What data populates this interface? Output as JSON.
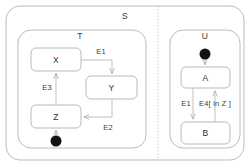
{
  "diagram": {
    "type": "uml-statechart",
    "title_visible": false,
    "colors": {
      "stroke": "#b5b5b5",
      "stroke_dark": "#9a9a9a",
      "text": "#3a3a3a",
      "fill": "#ffffff",
      "initial_fill": "#111111",
      "divider": "#c9c9c9"
    },
    "outer_state": {
      "name": "S",
      "label_x": 125,
      "label_y": 16
    },
    "divider": {
      "name": "orthogonal-region-divider",
      "style": "dashed",
      "x": 158,
      "y1": 6,
      "y2": 160
    },
    "regions": [
      {
        "name": "T",
        "label_x": 80,
        "label_y": 36,
        "box": {
          "x": 18,
          "y": 30,
          "w": 128,
          "h": 118
        }
      },
      {
        "name": "U",
        "label_x": 205,
        "label_y": 36,
        "box": {
          "x": 170,
          "y": 30,
          "w": 70,
          "h": 118
        }
      }
    ],
    "states": [
      {
        "id": "X",
        "label": "X",
        "x": 31,
        "y": 48,
        "w": 50,
        "h": 23
      },
      {
        "id": "Y",
        "label": "Y",
        "x": 86,
        "y": 76,
        "w": 51,
        "h": 23
      },
      {
        "id": "Z",
        "label": "Z",
        "x": 31,
        "y": 105,
        "w": 50,
        "h": 23
      },
      {
        "id": "A",
        "label": "A",
        "x": 181,
        "y": 67,
        "w": 49,
        "h": 21
      },
      {
        "id": "B",
        "label": "B",
        "x": 181,
        "y": 122,
        "w": 49,
        "h": 22
      }
    ],
    "initial_states": [
      {
        "id": "init-T",
        "cx": 56,
        "cy": 141,
        "r": 5.5,
        "target": "Z"
      },
      {
        "id": "init-U",
        "cx": 205,
        "cy": 54,
        "r": 5.5,
        "target": "A"
      }
    ],
    "transitions": [
      {
        "id": "t-x-y",
        "label": "E1",
        "from": "X",
        "to": "Y",
        "label_x": 101,
        "label_y": 52
      },
      {
        "id": "t-y-z",
        "label": "E2",
        "from": "Y",
        "to": "Z",
        "label_x": 108,
        "label_y": 128
      },
      {
        "id": "t-z-x",
        "label": "E3",
        "from": "Z",
        "to": "X",
        "label_x": 47,
        "label_y": 88
      },
      {
        "id": "t-a-b",
        "label": "E1",
        "from": "A",
        "to": "B",
        "label_x": 186,
        "label_y": 104
      },
      {
        "id": "t-b-a",
        "label": "E4[ in Z ]",
        "from": "B",
        "to": "A",
        "label_x": 215,
        "label_y": 104
      }
    ]
  }
}
